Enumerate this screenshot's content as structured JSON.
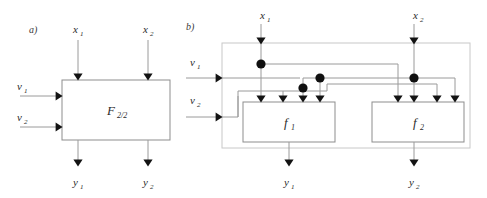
{
  "figure": {
    "panels": [
      {
        "id": "a",
        "label": "a)",
        "block": {
          "name": "F",
          "subscript": "2/2"
        },
        "inputs_top": [
          {
            "name": "x1",
            "base": "x",
            "sub": "1"
          },
          {
            "name": "x2",
            "base": "x",
            "sub": "2"
          }
        ],
        "inputs_left": [
          {
            "name": "v1",
            "base": "v",
            "sub": "1"
          },
          {
            "name": "v2",
            "base": "v",
            "sub": "2"
          }
        ],
        "outputs_bottom": [
          {
            "name": "y1",
            "base": "y",
            "sub": "1"
          },
          {
            "name": "y2",
            "base": "y",
            "sub": "2"
          }
        ]
      },
      {
        "id": "b",
        "label": "b)",
        "blocks": [
          {
            "name": "f1",
            "base": "f",
            "sub": "1",
            "input_arrow_count": 4
          },
          {
            "name": "f2",
            "base": "f",
            "sub": "2",
            "input_arrow_count": 4
          }
        ],
        "inputs_top": [
          {
            "name": "x1",
            "base": "x",
            "sub": "1"
          },
          {
            "name": "x2",
            "base": "x",
            "sub": "2"
          }
        ],
        "inputs_left": [
          {
            "name": "v1",
            "base": "v",
            "sub": "1"
          },
          {
            "name": "v2",
            "base": "v",
            "sub": "2"
          }
        ],
        "outputs_bottom": [
          {
            "name": "y1",
            "base": "y",
            "sub": "1"
          },
          {
            "name": "y2",
            "base": "y",
            "sub": "2"
          }
        ],
        "junction_dot_count": 4
      }
    ],
    "colors": {
      "wire": "#9a9a9a",
      "box_outline": "#8d8d8d",
      "outer_outline": "#c8c8c8",
      "arrowhead": "#131313",
      "junction_dot": "#101010",
      "text": "#2b2b2b",
      "background": "#ffffff"
    }
  }
}
